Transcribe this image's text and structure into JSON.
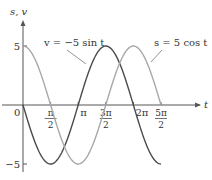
{
  "chart_data": {
    "type": "line",
    "title": "",
    "xlabel": "t",
    "ylabel": "s, v",
    "xlim": [
      0,
      8.9
    ],
    "ylim": [
      -5,
      5
    ],
    "grid": false,
    "x_ticks": [
      {
        "value": 1.5708,
        "num": "π",
        "den": "2"
      },
      {
        "value": 3.1416,
        "label": "π"
      },
      {
        "value": 4.7124,
        "num": "3π",
        "den": "2"
      },
      {
        "value": 6.2832,
        "label": "2π"
      },
      {
        "value": 7.854,
        "num": "5π",
        "den": "2"
      }
    ],
    "y_ticks": [
      {
        "value": 5,
        "label": "5"
      },
      {
        "value": -5,
        "label": "−5"
      }
    ],
    "origin_label": "0",
    "series": [
      {
        "name": "v = −5 sin t",
        "function": "-5*sin(t)",
        "t_range": [
          0,
          7.85
        ],
        "color": "#4a4a4a"
      },
      {
        "name": "s = 5 cos t",
        "function": "5*cos(t)",
        "t_range": [
          0,
          7.85
        ],
        "color": "#a8a8a8"
      }
    ],
    "annotations": [
      {
        "text": "v = −5 sin t",
        "points_to": "v"
      },
      {
        "text": "s = 5 cos t",
        "points_to": "s"
      }
    ]
  }
}
